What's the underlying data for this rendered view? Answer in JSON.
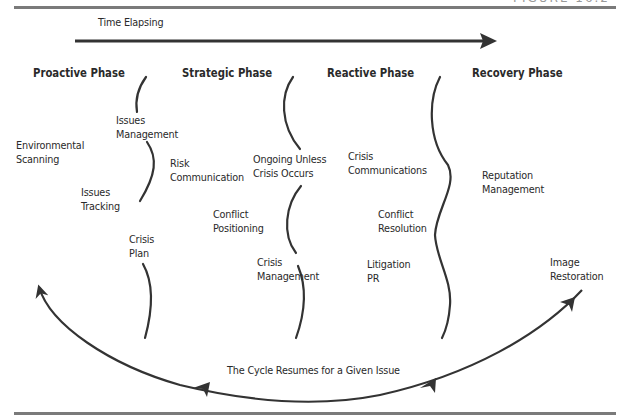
{
  "figure_label": "FIGURE 16.2",
  "colors": {
    "line": "#333333",
    "rule": "#7a7a7a",
    "text": "#2a2a2a"
  },
  "time_arrow": {
    "label": "Time Elapsing"
  },
  "phases": [
    {
      "title": "Proactive Phase"
    },
    {
      "title": "Strategic Phase"
    },
    {
      "title": "Reactive Phase"
    },
    {
      "title": "Recovery Phase"
    }
  ],
  "items": {
    "environmental_scanning": "Environmental\nScanning",
    "issues_management": "Issues\nManagement",
    "issues_tracking": "Issues\nTracking",
    "crisis_plan": "Crisis\nPlan",
    "risk_communication": "Risk\nCommunication",
    "conflict_positioning": "Conflict\nPositioning",
    "ongoing_unless": "Ongoing Unless\nCrisis Occurs",
    "crisis_management": "Crisis\nManagement",
    "crisis_communications": "Crisis\nCommunications",
    "conflict_resolution": "Conflict\nResolution",
    "litigation_pr": "Litigation\nPR",
    "reputation_management": "Reputation\nManagement",
    "image_restoration": "Image\nRestoration"
  },
  "cycle": {
    "label": "The Cycle Resumes for a Given Issue"
  }
}
